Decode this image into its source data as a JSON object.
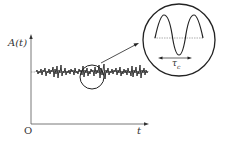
{
  "diagram": {
    "type": "signal-autocorrelation-illustration",
    "axes": {
      "y_label": "A(t)",
      "x_label": "t",
      "origin_label": "O"
    },
    "signal": "random fluctuating noise around constant mean",
    "inset": {
      "description": "magnified view of the signal showing oscillation",
      "time_label": "τc",
      "time_label_main": "τ",
      "time_label_sub": "c"
    },
    "colors": {
      "line": "#222222",
      "axis": "#555555",
      "dashed": "#777777"
    }
  }
}
